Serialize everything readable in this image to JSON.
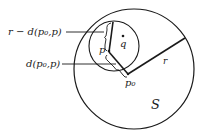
{
  "labels": {
    "r_minus_d": "r − d(p₀,p)",
    "d": "d(p₀,p)",
    "p": "p",
    "q": "q",
    "p0": "p₀",
    "r": "r",
    "S": "S"
  },
  "colors": {
    "stroke": "#1a1a1a",
    "background": "#ffffff"
  }
}
